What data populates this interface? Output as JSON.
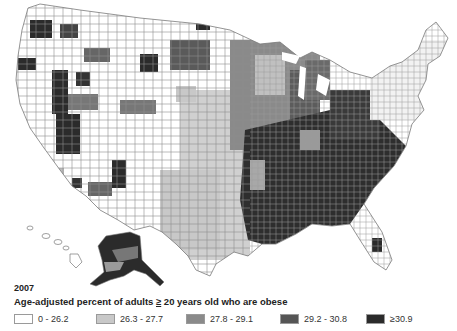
{
  "map": {
    "region": "United States (counties), incl. Alaska and Hawaii",
    "year": "2007",
    "caption_prefix": "Age-adjusted percent of adults ",
    "caption_ge": "≥",
    "caption_suffix": " 20 years old who are obese",
    "legend": [
      {
        "label": "0 - 26.2",
        "color": "#ffffff"
      },
      {
        "label": "26.3 - 27.7",
        "color": "#c8c8c8"
      },
      {
        "label": "27.8 - 29.1",
        "color": "#8a8a8a"
      },
      {
        "label": "29.2 - 30.8",
        "color": "#555555"
      },
      {
        "label": "≥30.9",
        "color": "#2b2b2b"
      }
    ],
    "patterns": {
      "west": "mostly white counties with scattered dark clusters (NW, Nevada/Arizona, Colorado)",
      "plains_texas": "mixed light grey and white",
      "midwest": "mixed grey/dark",
      "southeast": "predominantly darkest class (≥30.9)",
      "northeast": "mostly white",
      "florida": "mostly white with dark center"
    }
  }
}
